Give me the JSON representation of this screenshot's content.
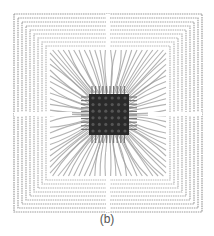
{
  "figure": {
    "caption": "(b)",
    "frame": {
      "x": 14,
      "y": 14,
      "w": 188,
      "h": 198
    },
    "die": {
      "x": 89,
      "y": 94,
      "w": 40,
      "h": 41
    },
    "rings": 9,
    "colors": {
      "background": "#ffffff",
      "ring": "#8a8a8a",
      "wire": "#9a9a9a",
      "die": "#2a2a2a",
      "caption": "#555555"
    }
  }
}
